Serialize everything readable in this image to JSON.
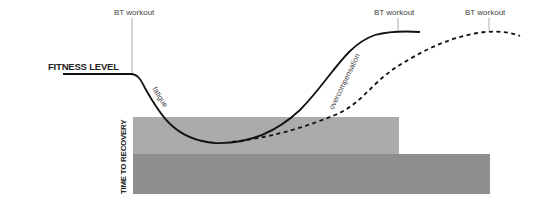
{
  "diagram": {
    "labels": {
      "fitness_level": "FITNESS LEVEL",
      "time_to_recovery": "TIME TO RECOVERY",
      "fatigue": "fatigue",
      "overcompensation": "overcompensation"
    },
    "markers": [
      {
        "label": "BT workout",
        "position": "start"
      },
      {
        "label": "BT workout",
        "position": "solid-curve-peak"
      },
      {
        "label": "BT workout",
        "position": "dashed-curve-peak"
      }
    ],
    "series": [
      {
        "name": "fitness-curve-fast-recovery",
        "style": "solid"
      },
      {
        "name": "fitness-curve-slow-recovery",
        "style": "dashed"
      }
    ],
    "recovery_bars": [
      {
        "name": "short-recovery",
        "color": "#ababab"
      },
      {
        "name": "long-recovery",
        "color": "#8e8e8e"
      }
    ],
    "colors": {
      "line": "#111111",
      "marker_line": "#9a9a9a",
      "bar_light": "#ababab",
      "bar_dark": "#8e8e8e"
    }
  }
}
